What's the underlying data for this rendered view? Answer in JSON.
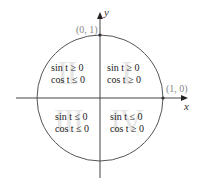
{
  "diagram": {
    "type": "unit-circle-quadrant-signs",
    "axes": {
      "x_label": "x",
      "y_label": "y"
    },
    "points": [
      {
        "label": "(0, 1)",
        "position": "top"
      },
      {
        "label": "(1, 0)",
        "position": "right"
      }
    ],
    "quadrants": [
      {
        "roman": "II",
        "line1": "sin t ≥ 0",
        "line2": "cos t ≤ 0"
      },
      {
        "roman": "I",
        "line1": "sin t ≥ 0",
        "line2": "cos t ≥ 0"
      },
      {
        "roman": "III",
        "line1": "sin t ≤ 0",
        "line2": "cos t ≤ 0"
      },
      {
        "roman": "IV",
        "line1": "sin t ≤ 0",
        "line2": "cos t ≥ 0"
      }
    ],
    "colors": {
      "lines": "#444444",
      "roman_watermark": "#e6e6e6",
      "point_labels": "#888888"
    }
  }
}
